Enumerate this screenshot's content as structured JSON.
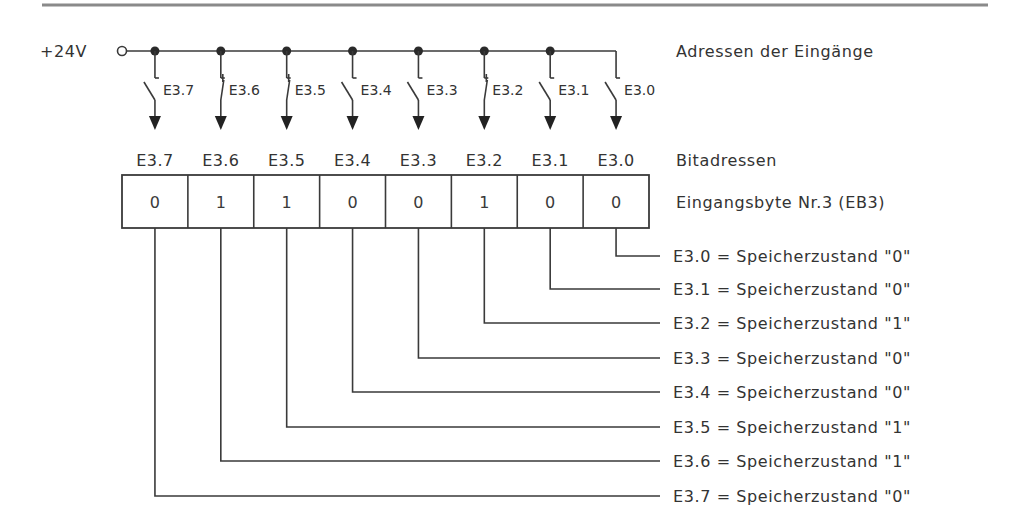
{
  "supply": {
    "label": "+24V"
  },
  "labels": {
    "input_addresses": "Adressen der Eingänge",
    "bit_addresses": "Bitadressen",
    "input_byte": "Eingangsbyte Nr.3 (EB3)"
  },
  "bits": [
    {
      "address": "E3.7",
      "value": "0",
      "switch_state": "open",
      "description": "E3.7 = Speicherzustand \"0\""
    },
    {
      "address": "E3.6",
      "value": "1",
      "switch_state": "closed",
      "description": "E3.6 = Speicherzustand \"1\""
    },
    {
      "address": "E3.5",
      "value": "1",
      "switch_state": "closed",
      "description": "E3.5 = Speicherzustand \"1\""
    },
    {
      "address": "E3.4",
      "value": "0",
      "switch_state": "open",
      "description": "E3.4 = Speicherzustand \"0\""
    },
    {
      "address": "E3.3",
      "value": "0",
      "switch_state": "open",
      "description": "E3.3 = Speicherzustand \"0\""
    },
    {
      "address": "E3.2",
      "value": "1",
      "switch_state": "closed",
      "description": "E3.2 = Speicherzustand \"1\""
    },
    {
      "address": "E3.1",
      "value": "0",
      "switch_state": "open",
      "description": "E3.1 = Speicherzustand \"0\""
    },
    {
      "address": "E3.0",
      "value": "0",
      "switch_state": "open",
      "description": "E3.0 = Speicherzustand \"0\""
    }
  ],
  "colors": {
    "line": "#3a3a3a",
    "text": "#333333",
    "rule": "#8a8a8a"
  }
}
